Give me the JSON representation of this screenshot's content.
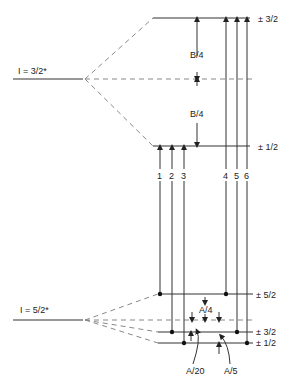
{
  "diagram": {
    "upper_state": {
      "label": "I = 3/2*",
      "sublevels": [
        {
          "label": "± 3/2",
          "y": 18
        },
        {
          "label": "± 1/2",
          "y": 146
        }
      ],
      "center_y": 79,
      "splitting_labels": [
        "B/4",
        "B/4"
      ]
    },
    "lower_state": {
      "label": "I = 5/2*",
      "sublevels": [
        {
          "label": "± 5/2",
          "y": 294
        },
        {
          "label": "± 3/2",
          "y": 332
        },
        {
          "label": "± 1/2",
          "y": 343
        }
      ],
      "center_y": 320,
      "splitting_labels": [
        "A/4",
        "A/20",
        "A/5"
      ]
    },
    "transitions": [
      {
        "number": "1",
        "x": 160,
        "from": "± 5/2",
        "to": "± 1/2"
      },
      {
        "number": "2",
        "x": 172,
        "from": "± 3/2",
        "to": "± 1/2"
      },
      {
        "number": "3",
        "x": 184,
        "from": "± 1/2",
        "to": "± 1/2"
      },
      {
        "number": "4",
        "x": 226,
        "from": "± 5/2",
        "to": "± 3/2"
      },
      {
        "number": "5",
        "x": 237,
        "from": "± 3/2",
        "to": "± 3/2"
      },
      {
        "number": "6",
        "x": 247,
        "from": "± 1/2",
        "to": "± 3/2"
      }
    ]
  }
}
